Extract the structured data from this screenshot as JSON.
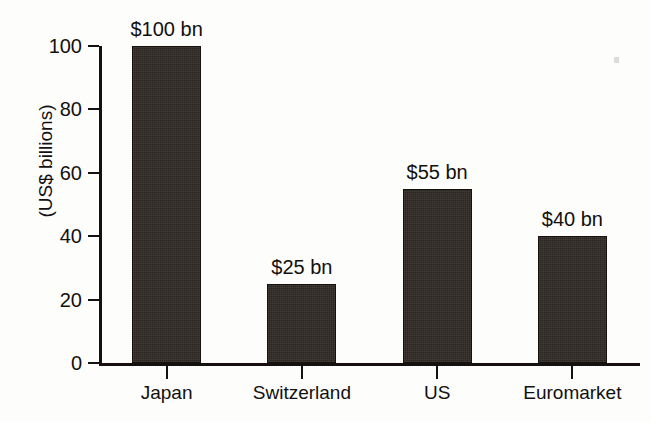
{
  "chart_data": {
    "type": "bar",
    "title": "",
    "subtitle": "",
    "xlabel": "",
    "ylabel": "(US$ billions)",
    "categories": [
      "Japan",
      "Switzerland",
      "US",
      "Euromarket"
    ],
    "values": [
      100,
      25,
      55,
      40
    ],
    "data_labels": [
      "$100 bn",
      "$25 bn",
      "$55 bn",
      "$40 bn"
    ],
    "ylim": [
      0,
      100
    ],
    "yticks": [
      0,
      20,
      40,
      60,
      80,
      100
    ],
    "ytick_labels": [
      "0",
      "20",
      "40",
      "60",
      "80",
      "100"
    ],
    "grid": false,
    "legend": null,
    "legend_position": "none",
    "bar_color": "#2b2521",
    "axis_color": "#141110",
    "background_color": "#fdfdfc",
    "units": "US$ billions"
  }
}
